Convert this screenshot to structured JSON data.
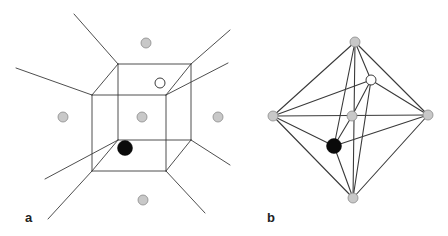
{
  "figure": {
    "panels": [
      {
        "label": "a",
        "description": "Cube with radiating lines (Voronoi-like cell) and surrounding sites",
        "cube": {
          "back_face": [
            [
              118,
              64
            ],
            [
              191,
              64
            ],
            [
              191,
              140
            ],
            [
              118,
              140
            ]
          ],
          "front_face": [
            [
              92,
              95
            ],
            [
              166,
              95
            ],
            [
              166,
              171
            ],
            [
              92,
              171
            ]
          ]
        },
        "rays": [
          [
            [
              74,
              14
            ],
            [
              118,
              64
            ]
          ],
          [
            [
              16,
              68
            ],
            [
              92,
              95
            ]
          ],
          [
            [
              230,
              30
            ],
            [
              191,
              64
            ]
          ],
          [
            [
              228,
              63
            ],
            [
              166,
              95
            ]
          ],
          [
            [
              45,
              179
            ],
            [
              118,
              140
            ]
          ],
          [
            [
              48,
              219
            ],
            [
              92,
              171
            ]
          ],
          [
            [
              230,
              165
            ],
            [
              191,
              140
            ]
          ],
          [
            [
              205,
              213
            ],
            [
              166,
              171
            ]
          ]
        ],
        "sites": [
          {
            "x": 146,
            "y": 43,
            "r": 5,
            "type": "gray"
          },
          {
            "x": 63,
            "y": 117,
            "r": 5,
            "type": "gray"
          },
          {
            "x": 142,
            "y": 117,
            "r": 5,
            "type": "gray"
          },
          {
            "x": 218,
            "y": 117,
            "r": 5,
            "type": "gray"
          },
          {
            "x": 143,
            "y": 200,
            "r": 5,
            "type": "gray"
          },
          {
            "x": 160,
            "y": 83,
            "r": 5,
            "type": "white"
          },
          {
            "x": 125,
            "y": 148,
            "r": 7.5,
            "type": "black"
          }
        ]
      },
      {
        "label": "b",
        "description": "Octahedral graph connecting sites",
        "nodes": {
          "top": {
            "x": 355,
            "y": 42,
            "r": 5,
            "type": "gray"
          },
          "left": {
            "x": 273,
            "y": 116,
            "r": 5,
            "type": "gray"
          },
          "center": {
            "x": 352,
            "y": 116,
            "r": 5,
            "type": "gray"
          },
          "right": {
            "x": 428,
            "y": 115,
            "r": 5,
            "type": "gray"
          },
          "bottom": {
            "x": 353,
            "y": 198,
            "r": 5,
            "type": "gray"
          },
          "white": {
            "x": 371,
            "y": 80,
            "r": 5,
            "type": "white"
          },
          "black": {
            "x": 334,
            "y": 146,
            "r": 7.5,
            "type": "black"
          }
        },
        "edges": [
          [
            "top",
            "left"
          ],
          [
            "top",
            "right"
          ],
          [
            "left",
            "bottom"
          ],
          [
            "right",
            "bottom"
          ],
          [
            "left",
            "right"
          ],
          [
            "top",
            "bottom"
          ],
          [
            "top",
            "white"
          ],
          [
            "top",
            "black"
          ],
          [
            "white",
            "left"
          ],
          [
            "white",
            "right"
          ],
          [
            "white",
            "center"
          ],
          [
            "white",
            "bottom"
          ],
          [
            "center",
            "black"
          ],
          [
            "black",
            "left"
          ],
          [
            "black",
            "right"
          ],
          [
            "black",
            "bottom"
          ]
        ]
      }
    ],
    "colors": {
      "line": "#3a3a3a",
      "gray_fill": "#c8c8c8",
      "gray_stroke": "#8a8a8a",
      "white_fill": "#ffffff",
      "white_stroke": "#3a3a3a",
      "black_fill": "#0a0a0a"
    }
  }
}
